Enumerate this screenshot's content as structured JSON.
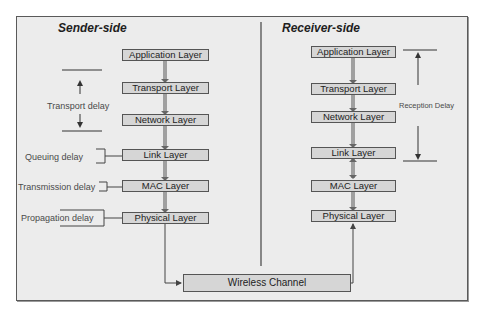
{
  "sender": {
    "title": "Sender-side",
    "layers": [
      {
        "label": "Application Layer"
      },
      {
        "label": "Transport Layer"
      },
      {
        "label": "Network Layer"
      },
      {
        "label": "Link Layer"
      },
      {
        "label": "MAC Layer"
      },
      {
        "label": "Physical Layer"
      }
    ],
    "delays": {
      "transport": "Transport delay",
      "queuing": "Queuing delay",
      "transmission": "Transmission delay",
      "propagation": "Propagation delay"
    }
  },
  "receiver": {
    "title": "Receiver-side",
    "layers": [
      {
        "label": "Application Layer"
      },
      {
        "label": "Transport Layer"
      },
      {
        "label": "Network Layer"
      },
      {
        "label": "Link Layer"
      },
      {
        "label": "MAC Layer"
      },
      {
        "label": "Physical Layer"
      }
    ],
    "delays": {
      "reception": "Reception Delay"
    }
  },
  "channel": {
    "label": "Wireless Channel"
  },
  "colors": {
    "background": "#ececec",
    "box_fill": "#d6d6d6",
    "stroke": "#555555"
  }
}
